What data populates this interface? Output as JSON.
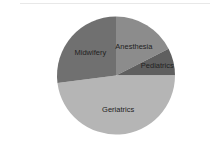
{
  "chart_data": {
    "type": "pie",
    "title": "",
    "slices": [
      {
        "label": "Anesthesia",
        "value": 17.5,
        "color": "#8c8c8c"
      },
      {
        "label": "Pediatrics",
        "value": 7.5,
        "color": "#5f5f5f"
      },
      {
        "label": "Geriatrics",
        "value": 48,
        "color": "#b5b5b5"
      },
      {
        "label": "Midwifery",
        "value": 27,
        "color": "#707070"
      }
    ],
    "start_angle_deg": 0,
    "direction": "clockwise",
    "legend": "none",
    "labels_inside": true
  }
}
